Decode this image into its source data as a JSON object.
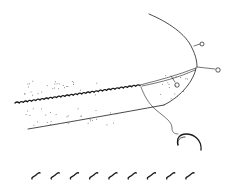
{
  "figure": {
    "kind": "scientific line illustration",
    "colors": {
      "ink": "#1a1a1a",
      "background": "#ffffff",
      "stipple": "#555555"
    },
    "parts": [
      {
        "id": "upper-curved-margin",
        "description": "long arched outer margin"
      },
      {
        "id": "serrated-edge",
        "description": "saw-toothed ridge along the length"
      },
      {
        "id": "lower-margin",
        "description": "lower outline of the body"
      },
      {
        "id": "terminal-lobe",
        "description": "stippled rounded tip region"
      },
      {
        "id": "bristles",
        "count": 3,
        "description": "setae ending in small round knobs"
      },
      {
        "id": "hooked-appendage",
        "description": "thin stalk ending in a C-shaped hook"
      },
      {
        "id": "scale-marks",
        "count": 9,
        "description": "row of small S-shaped marks below figure"
      }
    ],
    "scale_mark_count": 9,
    "bristle_count": 3
  }
}
